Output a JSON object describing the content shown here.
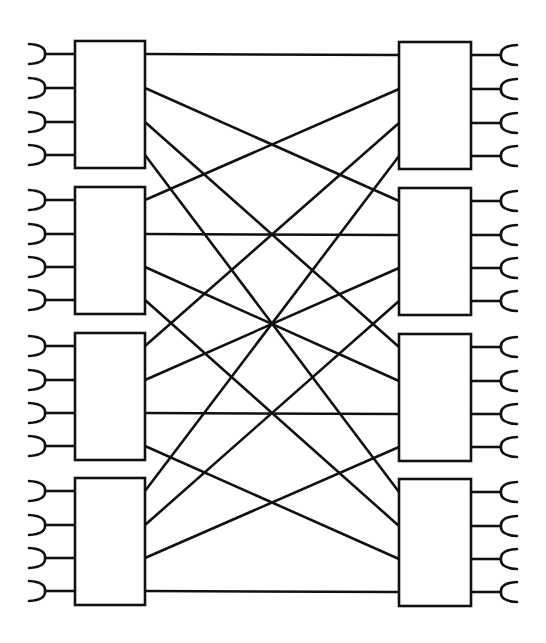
{
  "diagram": {
    "type": "4x4 switch interconnection network",
    "colors": {
      "stroke": "#111111",
      "background": "#ffffff"
    },
    "left_stage": {
      "box_x": 75,
      "box_w": 70,
      "box_h": 127,
      "boxes": [
        {
          "id": "L1",
          "y": 41,
          "ports_y": [
            54,
            88,
            122,
            155
          ]
        },
        {
          "id": "L2",
          "y": 187,
          "ports_y": [
            200,
            234,
            267,
            300
          ]
        },
        {
          "id": "L3",
          "y": 333,
          "ports_y": [
            346,
            380,
            413,
            446
          ]
        },
        {
          "id": "L4",
          "y": 478,
          "ports_y": [
            491,
            525,
            558,
            591
          ]
        }
      ],
      "cup_direction": "left"
    },
    "right_stage": {
      "box_x": 399,
      "box_w": 72,
      "box_h": 127,
      "boxes": [
        {
          "id": "R1",
          "y": 42,
          "ports_y": [
            55,
            89,
            123,
            156
          ]
        },
        {
          "id": "R2",
          "y": 188,
          "ports_y": [
            201,
            235,
            268,
            301
          ]
        },
        {
          "id": "R3",
          "y": 334,
          "ports_y": [
            347,
            381,
            414,
            447
          ]
        },
        {
          "id": "R4",
          "y": 479,
          "ports_y": [
            492,
            526,
            559,
            592
          ]
        }
      ],
      "cup_direction": "right"
    },
    "connection_rule": "left box j, output port i -> right box i, input port j",
    "connections": [
      [
        "L1.1",
        "R1.1"
      ],
      [
        "L1.2",
        "R2.1"
      ],
      [
        "L1.3",
        "R3.1"
      ],
      [
        "L1.4",
        "R4.1"
      ],
      [
        "L2.1",
        "R1.2"
      ],
      [
        "L2.2",
        "R2.2"
      ],
      [
        "L2.3",
        "R3.2"
      ],
      [
        "L2.4",
        "R4.2"
      ],
      [
        "L3.1",
        "R1.3"
      ],
      [
        "L3.2",
        "R2.3"
      ],
      [
        "L3.3",
        "R3.3"
      ],
      [
        "L3.4",
        "R4.3"
      ],
      [
        "L4.1",
        "R1.4"
      ],
      [
        "L4.2",
        "R2.4"
      ],
      [
        "L4.3",
        "R3.4"
      ],
      [
        "L4.4",
        "R4.4"
      ]
    ]
  }
}
